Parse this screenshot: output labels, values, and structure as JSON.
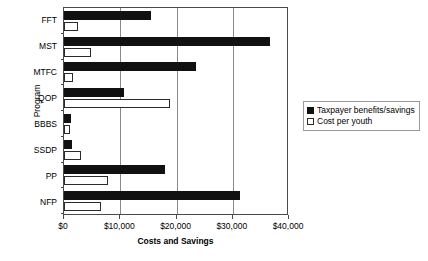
{
  "chart_data": {
    "type": "bar",
    "orientation": "horizontal",
    "title": "",
    "xlabel": "Costs and Savings",
    "ylabel": "Program",
    "categories": [
      "FFT",
      "MST",
      "MTFC",
      "QOP",
      "BBBS",
      "SSDP",
      "PP",
      "NFP"
    ],
    "series": [
      {
        "name": "Taxpayer benefits/savings",
        "color": "#111111",
        "values": [
          15500,
          36600,
          23500,
          10700,
          1200,
          1400,
          18000,
          31200
        ]
      },
      {
        "name": "Cost per youth",
        "color": "#ffffff",
        "values": [
          2500,
          4800,
          1600,
          18900,
          1100,
          3000,
          7900,
          6600
        ]
      }
    ],
    "xlim": [
      0,
      40000
    ],
    "xticks": [
      0,
      10000,
      20000,
      30000,
      40000
    ],
    "xtick_labels": [
      "$0",
      "$10,000",
      "$20,000",
      "$30,000",
      "$40,000"
    ],
    "gridlines": [
      10000,
      20000,
      30000
    ],
    "grid": true,
    "legend_position": "right"
  },
  "legend": {
    "entries": [
      {
        "label": "Taxpayer benefits/savings",
        "swatch": "filled-square-icon"
      },
      {
        "label": "Cost per youth",
        "swatch": "open-square-icon"
      }
    ]
  }
}
